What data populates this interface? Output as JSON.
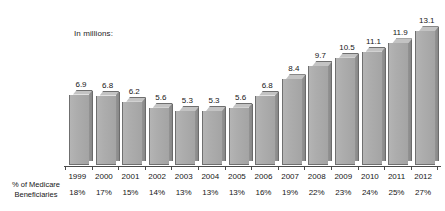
{
  "chart_data": {
    "type": "bar",
    "title": "",
    "subtitle": "",
    "units_label": "In millions:",
    "xlabel": "",
    "ylabel": "",
    "ylim": [
      0,
      14
    ],
    "grid": false,
    "legend": "none",
    "style": "3d-vertical-bars",
    "categories": [
      "1999",
      "2000",
      "2001",
      "2002",
      "2003",
      "2004",
      "2005",
      "2006",
      "2007",
      "2008",
      "2009",
      "2010",
      "2011",
      "2012"
    ],
    "values": [
      6.9,
      6.8,
      6.2,
      5.6,
      5.3,
      5.3,
      5.6,
      6.8,
      8.4,
      9.7,
      10.5,
      11.1,
      11.9,
      13.1
    ],
    "value_labels": [
      "6.9",
      "6.8",
      "6.2",
      "5.6",
      "5.3",
      "5.3",
      "5.6",
      "6.8",
      "8.4",
      "9.7",
      "10.5",
      "11.1",
      "11.9",
      "13.1"
    ],
    "secondary_row": {
      "caption_line1": "% of Medicare",
      "caption_line2": "Beneficiaries",
      "values": [
        "18%",
        "17%",
        "15%",
        "14%",
        "13%",
        "13%",
        "13%",
        "16%",
        "19%",
        "22%",
        "23%",
        "24%",
        "25%",
        "27%"
      ]
    },
    "colors": {
      "bar_front": "#adadad",
      "bar_side": "#8d8d8d",
      "bar_top": "#c3c3c3",
      "bar_outline": "#6f6f6f",
      "axis": "#4a4a4a",
      "text": "#161616",
      "background": "#ffffff"
    }
  }
}
